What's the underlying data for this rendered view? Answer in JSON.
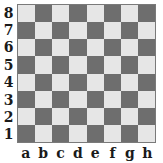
{
  "board": {
    "ranks": [
      "8",
      "7",
      "6",
      "5",
      "4",
      "3",
      "2",
      "1"
    ],
    "files": [
      "a",
      "b",
      "c",
      "d",
      "e",
      "f",
      "g",
      "h"
    ],
    "colors": {
      "light": "#e6e6e6",
      "dark": "#6e6e6e",
      "border": "#7a7a7a"
    },
    "pieces": []
  }
}
